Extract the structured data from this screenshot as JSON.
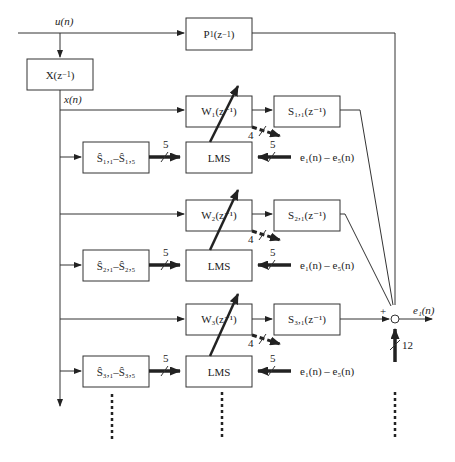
{
  "diagram": {
    "type": "multichannel adaptive filter block diagram",
    "input_signal": "u(n)",
    "filtered_reference": "x(n)",
    "reference_filter": "X(z⁻¹)",
    "primary_path": "P₁(z⁻¹)",
    "output_error": "e₁(n)",
    "sum_plus_sign": "+",
    "sum_bus_width": "12",
    "channels": [
      {
        "adaptive_filter": "W₁(z⁻¹)",
        "secondary_path": "S₁,₁(z⁻¹)",
        "model_bank": "Ŝ₁,₁–Ŝ₁,₅",
        "model_bank_main": "S",
        "model_first_sub": "1,1",
        "model_last_sub": "1,5",
        "lms": "LMS",
        "model_bus_width": "5",
        "error_bus_width": "5",
        "output_bus_width": "4",
        "error_input": "e₁(n) – e₅(n)"
      },
      {
        "adaptive_filter": "W₂(z⁻¹)",
        "secondary_path": "S₂,₁(z⁻¹)",
        "model_bank": "Ŝ₂,₁–Ŝ₂,₅",
        "model_bank_main": "S",
        "model_first_sub": "2,1",
        "model_last_sub": "2,5",
        "lms": "LMS",
        "model_bus_width": "5",
        "error_bus_width": "5",
        "output_bus_width": "4",
        "error_input": "e₁(n) – e₅(n)"
      },
      {
        "adaptive_filter": "W₃(z⁻¹)",
        "secondary_path": "S₃,₁(z⁻¹)",
        "model_bank": "Ŝ₃,₁–Ŝ₃,₅",
        "model_bank_main": "S",
        "model_first_sub": "3,1",
        "model_last_sub": "3,5",
        "lms": "LMS",
        "model_bus_width": "5",
        "error_bus_width": "5",
        "output_bus_width": "4",
        "error_input": "e₁(n) – e₅(n)"
      }
    ],
    "text": {
      "u": "u(n)",
      "x": "x(n)",
      "X_main": "X(z",
      "P_main": "P",
      "P_sub": "1",
      "z_inv": "(z",
      "inv_exp": "−1",
      "close": ")",
      "W_main": "W",
      "S_main": "S",
      "e_main": "e",
      "e1_sub": "1",
      "e5_sub": "5",
      "n_paren": "(n)",
      "dash": " – ",
      "lms": "LMS",
      "five": "5",
      "four": "4",
      "twelve": "12",
      "plus": "+",
      "sep": "–"
    }
  }
}
